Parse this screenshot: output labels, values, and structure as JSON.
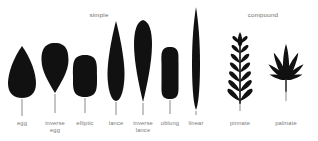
{
  "figure": {
    "title_groups": [
      {
        "label": "simple",
        "x": 99,
        "y": 11
      },
      {
        "label": "compound",
        "x": 263,
        "y": 11
      }
    ],
    "background_color": "#ffffff",
    "leaf_fill_color": "#111111",
    "stem_color": "#8a8a8a",
    "label_color": "#777777"
  },
  "leaves": [
    {
      "name": "egg",
      "label_line1": "egg",
      "label_line2": "",
      "shape": "ovate",
      "group": "simple",
      "center_x": 22,
      "blade_width": 28,
      "blade_height": 52,
      "blade_top": 44,
      "stem_length": 17
    },
    {
      "name": "inverse-egg",
      "label_line1": "inverse",
      "label_line2": "egg",
      "shape": "obovate",
      "group": "simple",
      "center_x": 55,
      "blade_width": 27,
      "blade_height": 50,
      "blade_top": 41,
      "stem_length": 19
    },
    {
      "name": "elliptic",
      "label_line1": "elliptic",
      "label_line2": "",
      "shape": "elliptic",
      "group": "simple",
      "center_x": 85,
      "blade_width": 24,
      "blade_height": 42,
      "blade_top": 53,
      "stem_length": 15
    },
    {
      "name": "lance",
      "label_line1": "lance",
      "label_line2": "",
      "shape": "lanceolate",
      "group": "simple",
      "center_x": 116,
      "blade_width": 17,
      "blade_height": 80,
      "blade_top": 19,
      "stem_length": 13
    },
    {
      "name": "inverse-lance",
      "label_line1": "inverse",
      "label_line2": "lance",
      "shape": "oblanceolate",
      "group": "simple",
      "center_x": 143,
      "blade_width": 18,
      "blade_height": 82,
      "blade_top": 18,
      "stem_length": 12
    },
    {
      "name": "oblong",
      "label_line1": "oblong",
      "label_line2": "",
      "shape": "oblong",
      "group": "simple",
      "center_x": 170,
      "blade_width": 17,
      "blade_height": 52,
      "blade_top": 45,
      "stem_length": 14
    },
    {
      "name": "linear",
      "label_line1": "linear",
      "label_line2": "",
      "shape": "linear",
      "group": "simple",
      "center_x": 196,
      "blade_width": 8,
      "blade_height": 103,
      "blade_top": 5,
      "stem_length": 4
    },
    {
      "name": "pinnate",
      "label_line1": "pinnate",
      "label_line2": "",
      "shape": "pinnate",
      "group": "compound",
      "center_x": 240,
      "blade_width": 34,
      "blade_height": 72,
      "blade_top": 32,
      "stem_length": 8,
      "leaflet_pairs": 7
    },
    {
      "name": "palmate",
      "label_line1": "palmate",
      "label_line2": "",
      "shape": "palmate",
      "group": "compound",
      "center_x": 286,
      "blade_width": 40,
      "blade_height": 50,
      "blade_top": 42,
      "stem_length": 10,
      "leaflet_count": 7
    }
  ]
}
